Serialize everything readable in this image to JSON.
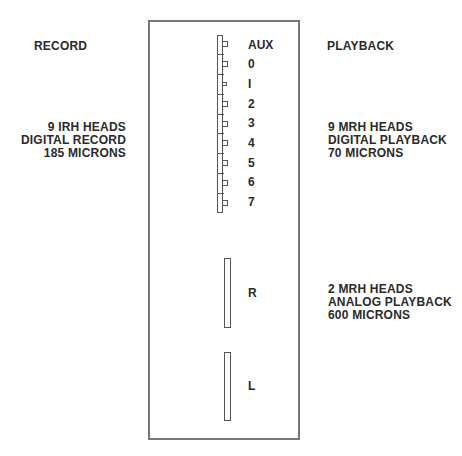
{
  "diagram": {
    "title_partial": "",
    "left": {
      "section_title": "RECORD",
      "digital_group": [
        "9 IRH HEADS",
        "DIGITAL RECORD",
        "185 MICRONS"
      ]
    },
    "right": {
      "section_title": "PLAYBACK",
      "digital_group": [
        "9 MRH HEADS",
        "DIGITAL PLAYBACK",
        "70 MICRONS"
      ],
      "analog_group": [
        "2 MRH HEADS",
        "ANALOG PLAYBACK",
        "600 MICRONS"
      ]
    },
    "digital_heads": [
      "AUX",
      "0",
      "I",
      "2",
      "3",
      "4",
      "5",
      "6",
      "7"
    ],
    "analog_heads": [
      "R",
      "L"
    ],
    "colors": {
      "line": "#555555",
      "frame": "#777777",
      "text": "#2a2a2a"
    }
  }
}
